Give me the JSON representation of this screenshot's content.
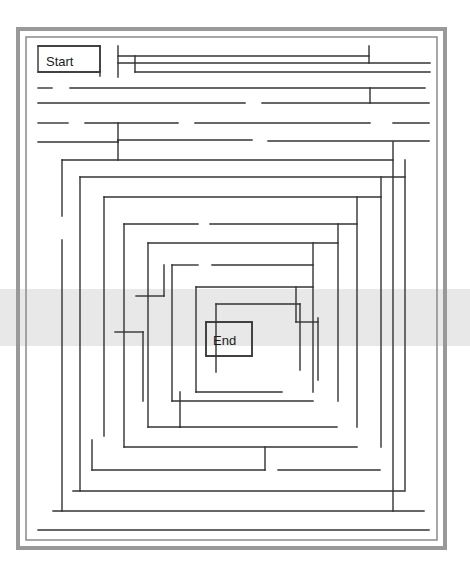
{
  "page": {
    "background_color": "#ffffff",
    "scan_band_color": "#e8e8e8",
    "wall_color": "#333333",
    "frame_color": "#888888"
  },
  "maze": {
    "start_label": "Start",
    "end_label": "End",
    "shape": "rectangular-spiral",
    "ring_count": 12,
    "outer_frame": {
      "x": 18,
      "y": 29,
      "width": 427,
      "height": 519
    },
    "inner_frame": {
      "x": 26,
      "y": 37,
      "width": 411,
      "height": 503
    },
    "start_box": {
      "x": 38,
      "y": 46,
      "width": 62,
      "height": 26
    },
    "end_box": {
      "x": 206,
      "y": 322,
      "width": 46,
      "height": 34
    },
    "rings": [
      {
        "x": 38,
        "y": 46,
        "width": 391,
        "height": 485
      },
      {
        "x": 48,
        "y": 58,
        "width": 371,
        "height": 462
      },
      {
        "x": 58,
        "y": 72,
        "width": 351,
        "height": 437
      },
      {
        "x": 68,
        "y": 86,
        "width": 331,
        "height": 411
      },
      {
        "x": 78,
        "y": 100,
        "width": 311,
        "height": 385
      },
      {
        "x": 88,
        "y": 114,
        "width": 291,
        "height": 359
      },
      {
        "x": 98,
        "y": 128,
        "width": 271,
        "height": 333
      },
      {
        "x": 110,
        "y": 160,
        "width": 249,
        "height": 275
      },
      {
        "x": 126,
        "y": 181,
        "width": 217,
        "height": 233
      },
      {
        "x": 150,
        "y": 205,
        "width": 169,
        "height": 185
      },
      {
        "x": 178,
        "y": 232,
        "width": 113,
        "height": 131
      },
      {
        "x": 206,
        "y": 322,
        "width": 46,
        "height": 34
      }
    ]
  },
  "walls": {
    "horizontal": [
      {
        "id": "h-start-top",
        "x1": 38,
        "x2": 100,
        "y": 46
      },
      {
        "id": "h-start-bottom",
        "x1": 38,
        "x2": 100,
        "y": 72
      },
      {
        "id": "h-top-a",
        "x1": 118,
        "x2": 369,
        "y": 56
      },
      {
        "id": "h-top-b",
        "x1": 118,
        "x2": 430,
        "y": 63
      },
      {
        "id": "h-top-c",
        "x1": 135,
        "x2": 430,
        "y": 72
      },
      {
        "id": "h-row2-a",
        "x1": 38,
        "x2": 52,
        "y": 88
      },
      {
        "id": "h-row2-b",
        "x1": 70,
        "x2": 425,
        "y": 88
      },
      {
        "id": "h-row3-a",
        "x1": 38,
        "x2": 245,
        "y": 103
      },
      {
        "id": "h-row3-b",
        "x1": 262,
        "x2": 429,
        "y": 103
      },
      {
        "id": "h-row4-a",
        "x1": 38,
        "x2": 68,
        "y": 123
      },
      {
        "id": "h-row4-b",
        "x1": 85,
        "x2": 178,
        "y": 123
      },
      {
        "id": "h-row4-c",
        "x1": 195,
        "x2": 370,
        "y": 123
      },
      {
        "id": "h-row4-d",
        "x1": 393,
        "x2": 429,
        "y": 123
      },
      {
        "id": "h-row5-a",
        "x1": 38,
        "x2": 118,
        "y": 142
      },
      {
        "id": "h-row5-b",
        "x1": 118,
        "x2": 252,
        "y": 140
      },
      {
        "id": "h-row5-c",
        "x1": 268,
        "x2": 429,
        "y": 141
      },
      {
        "id": "h-ring7-top",
        "x1": 62,
        "x2": 393,
        "y": 160
      },
      {
        "id": "h-ring8-top",
        "x1": 80,
        "x2": 405,
        "y": 177
      },
      {
        "id": "h-ring9-top",
        "x1": 104,
        "x2": 381,
        "y": 197
      },
      {
        "id": "h-ring10-top-l",
        "x1": 124,
        "x2": 198,
        "y": 224
      },
      {
        "id": "h-ring10-top-r",
        "x1": 210,
        "x2": 357,
        "y": 224
      },
      {
        "id": "h-ring11-top",
        "x1": 148,
        "x2": 338,
        "y": 243
      },
      {
        "id": "h-ring12-top-l",
        "x1": 172,
        "x2": 198,
        "y": 265
      },
      {
        "id": "h-ring12-top-r",
        "x1": 212,
        "x2": 313,
        "y": 265
      },
      {
        "id": "h-core-top",
        "x1": 196,
        "x2": 313,
        "y": 287
      },
      {
        "id": "h-mid-l1",
        "x1": 136,
        "x2": 164,
        "y": 296
      },
      {
        "id": "h-mid-l2",
        "x1": 115,
        "x2": 143,
        "y": 332
      },
      {
        "id": "h-inner-top",
        "x1": 216,
        "x2": 300,
        "y": 304
      },
      {
        "id": "h-end-top",
        "x1": 206,
        "x2": 252,
        "y": 322
      },
      {
        "id": "h-end-bottom",
        "x1": 206,
        "x2": 252,
        "y": 356
      },
      {
        "id": "h-inner-r",
        "x1": 296,
        "x2": 318,
        "y": 322
      },
      {
        "id": "h-core-bot",
        "x1": 196,
        "x2": 282,
        "y": 392
      },
      {
        "id": "h-ring12-bot",
        "x1": 172,
        "x2": 313,
        "y": 401
      },
      {
        "id": "h-ring11-bot-l",
        "x1": 148,
        "x2": 180,
        "y": 427
      },
      {
        "id": "h-ring11-bot-r",
        "x1": 180,
        "x2": 337,
        "y": 427
      },
      {
        "id": "h-ring10-bot",
        "x1": 124,
        "x2": 357,
        "y": 447
      },
      {
        "id": "h-ring9-bot-l",
        "x1": 92,
        "x2": 265,
        "y": 470
      },
      {
        "id": "h-ring9-bot-r",
        "x1": 278,
        "x2": 380,
        "y": 470
      },
      {
        "id": "h-ring8-bot",
        "x1": 73,
        "x2": 404,
        "y": 491
      },
      {
        "id": "h-ring7-bot",
        "x1": 53,
        "x2": 424,
        "y": 511
      },
      {
        "id": "h-ring6-bot",
        "x1": 38,
        "x2": 429,
        "y": 530
      }
    ],
    "vertical": [
      {
        "id": "v-start-right",
        "y1": 46,
        "y2": 76,
        "x": 100
      },
      {
        "id": "v-top-1",
        "y1": 46,
        "y2": 77,
        "x": 118
      },
      {
        "id": "v-top-2",
        "y1": 56,
        "y2": 72,
        "x": 135
      },
      {
        "id": "v-top-3",
        "y1": 46,
        "y2": 63,
        "x": 369
      },
      {
        "id": "v-row3-1",
        "y1": 88,
        "y2": 103,
        "x": 370
      },
      {
        "id": "v-row4-1",
        "y1": 123,
        "y2": 142,
        "x": 118
      },
      {
        "id": "v-row5-1",
        "y1": 140,
        "y2": 160,
        "x": 118
      },
      {
        "id": "v-ring7-left",
        "y1": 160,
        "y2": 216,
        "x": 62
      },
      {
        "id": "v-ring7-left-b",
        "y1": 240,
        "y2": 511,
        "x": 62
      },
      {
        "id": "v-ring7-right",
        "y1": 142,
        "y2": 511,
        "x": 393
      },
      {
        "id": "v-ring8-left",
        "y1": 177,
        "y2": 491,
        "x": 80
      },
      {
        "id": "v-ring8-right",
        "y1": 160,
        "y2": 491,
        "x": 405
      },
      {
        "id": "v-ring9-left",
        "y1": 197,
        "y2": 436,
        "x": 104
      },
      {
        "id": "v-ring9-left-b",
        "y1": 440,
        "y2": 470,
        "x": 92
      },
      {
        "id": "v-ring9-right",
        "y1": 177,
        "y2": 447,
        "x": 381
      },
      {
        "id": "v-ring10-left",
        "y1": 224,
        "y2": 447,
        "x": 124
      },
      {
        "id": "v-ring10-right",
        "y1": 197,
        "y2": 427,
        "x": 357
      },
      {
        "id": "v-ring11-left",
        "y1": 243,
        "y2": 427,
        "x": 148
      },
      {
        "id": "v-ring11-right",
        "y1": 224,
        "y2": 401,
        "x": 338
      },
      {
        "id": "v-ring12-left",
        "y1": 265,
        "y2": 401,
        "x": 172
      },
      {
        "id": "v-ring12-right",
        "y1": 243,
        "y2": 392,
        "x": 313
      },
      {
        "id": "v-core-left",
        "y1": 287,
        "y2": 392,
        "x": 196
      },
      {
        "id": "v-core-right",
        "y1": 287,
        "y2": 322,
        "x": 296
      },
      {
        "id": "v-inner-left",
        "y1": 304,
        "y2": 372,
        "x": 216
      },
      {
        "id": "v-inner-right",
        "y1": 304,
        "y2": 370,
        "x": 300
      },
      {
        "id": "v-end-left",
        "y1": 322,
        "y2": 356,
        "x": 206
      },
      {
        "id": "v-end-right",
        "y1": 322,
        "y2": 356,
        "x": 252
      },
      {
        "id": "v-mid-1",
        "y1": 265,
        "y2": 296,
        "x": 164
      },
      {
        "id": "v-mid-2",
        "y1": 332,
        "y2": 401,
        "x": 143
      },
      {
        "id": "v-bot-1",
        "y1": 392,
        "y2": 427,
        "x": 180
      },
      {
        "id": "v-bot-2",
        "y1": 447,
        "y2": 470,
        "x": 265
      },
      {
        "id": "v-inner-far-r",
        "y1": 318,
        "y2": 380,
        "x": 318
      }
    ]
  }
}
